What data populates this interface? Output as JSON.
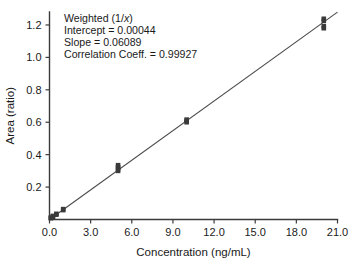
{
  "chart_data": {
    "type": "scatter",
    "title": "",
    "xlabel": "Concentration (ng/mL)",
    "ylabel": "Area (ratio)",
    "xlim": [
      0.0,
      21.0
    ],
    "ylim": [
      0.0,
      1.28
    ],
    "xticks": [
      "0.0",
      "3.0",
      "6.0",
      "9.0",
      "12.0",
      "15.0",
      "18.0",
      "21.0"
    ],
    "xtick_values": [
      0.0,
      3.0,
      6.0,
      9.0,
      12.0,
      15.0,
      18.0,
      21.0
    ],
    "yticks": [
      "0.2",
      "0.4",
      "0.6",
      "0.8",
      "1.0",
      "1.2"
    ],
    "ytick_values": [
      0.2,
      0.4,
      0.6,
      0.8,
      1.0,
      1.2
    ],
    "grid": false,
    "legend": "none",
    "marker_style": "filled-square",
    "marker_color": "#3a3a3a",
    "line_color": "#4a4a4a",
    "axis_color": "#3b3b3b",
    "background_color": "#ffffff",
    "series": [
      {
        "name": "Calibration standards",
        "points": [
          [
            0.1,
            0.008
          ],
          [
            0.1,
            0.012
          ],
          [
            0.25,
            0.017
          ],
          [
            0.25,
            0.022
          ],
          [
            0.5,
            0.03
          ],
          [
            0.5,
            0.035
          ],
          [
            1.0,
            0.058
          ],
          [
            1.0,
            0.064
          ],
          [
            5.0,
            0.3
          ],
          [
            5.0,
            0.312
          ],
          [
            5.0,
            0.322
          ],
          [
            5.0,
            0.335
          ],
          [
            10.0,
            0.6
          ],
          [
            10.0,
            0.608
          ],
          [
            10.0,
            0.616
          ],
          [
            20.0,
            1.18
          ],
          [
            20.0,
            1.192
          ],
          [
            20.0,
            1.225
          ],
          [
            20.0,
            1.238
          ]
        ]
      }
    ],
    "fit": {
      "type": "linear",
      "slope": 0.06089,
      "intercept": 0.00044,
      "x_start": 0.0,
      "x_end": 21.0
    }
  },
  "annotation": {
    "weighting_prefix": "Weighted (1/",
    "weighting_var": "x",
    "weighting_suffix": ")",
    "intercept": "Intercept = 0.00044",
    "slope": "Slope = 0.06089",
    "correlation": "Correlation Coeff. = 0.99927"
  },
  "axes": {
    "x_title": "Concentration (ng/mL)",
    "y_title": "Area (ratio)",
    "x_tick_labels": [
      "0.0",
      "3.0",
      "6.0",
      "9.0",
      "12.0",
      "15.0",
      "18.0",
      "21.0"
    ],
    "y_tick_labels": [
      "0.2",
      "0.4",
      "0.6",
      "0.8",
      "1.0",
      "1.2"
    ]
  }
}
